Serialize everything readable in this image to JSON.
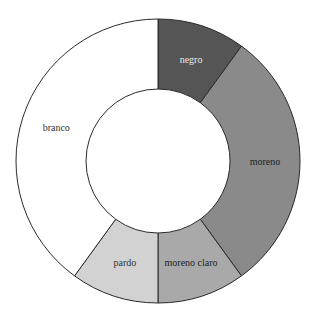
{
  "chart_data": {
    "type": "pie",
    "variant": "donut",
    "title": "",
    "categories": [
      "negro",
      "moreno",
      "moreno claro",
      "pardo",
      "branco"
    ],
    "values": [
      10,
      30,
      10,
      10,
      40
    ],
    "colors": [
      "#555555",
      "#8a8a8a",
      "#a9a9a9",
      "#d2d2d2",
      "#ffffff"
    ],
    "label_colors": [
      "#e8e8e8",
      "#222222",
      "#222222",
      "#333333",
      "#333333"
    ],
    "start_angle_deg": 0,
    "direction": "clockwise",
    "legend": "none (labels inside slices)"
  },
  "geometry": {
    "cx": 158,
    "cy": 161,
    "outer_r": 142,
    "inner_r": 72
  }
}
